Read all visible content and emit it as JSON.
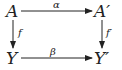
{
  "diagram": {
    "type": "commutative-square",
    "nodes": {
      "top_left": "A",
      "top_right": "A′",
      "bottom_left": "Y",
      "bottom_right": "Y′"
    },
    "arrows": {
      "top": {
        "label": "α",
        "from": "A",
        "to": "A′"
      },
      "left": {
        "label": "f",
        "from": "A",
        "to": "Y"
      },
      "right": {
        "label": "f′",
        "from": "A′",
        "to": "Y′"
      },
      "bottom": {
        "label": "β",
        "from": "Y",
        "to": "Y′"
      }
    },
    "colors": {
      "ink": "#222222",
      "background": "#ffffff"
    }
  }
}
